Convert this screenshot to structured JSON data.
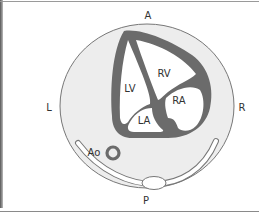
{
  "figure": {
    "orientation_labels": {
      "anterior": "A",
      "posterior": "P",
      "left": "L",
      "right": "R"
    },
    "structure_labels": {
      "left_ventricle": "LV",
      "right_ventricle": "RV",
      "right_atrium": "RA",
      "left_atrium": "LA",
      "aorta": "Ao"
    },
    "colors": {
      "background": "#ffffff",
      "field_fill": "#ededed",
      "field_stroke": "#777777",
      "myocardium": "#6b6b6b",
      "cavity": "#ffffff",
      "label_text": "#333333"
    }
  }
}
